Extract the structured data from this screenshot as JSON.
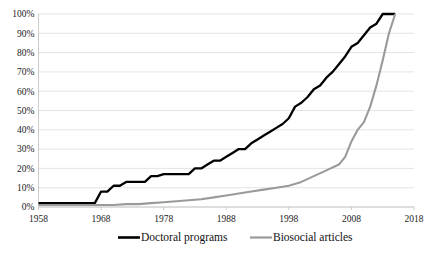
{
  "chart_data": {
    "type": "line",
    "title": "",
    "subtitle": "",
    "xlabel": "",
    "ylabel": "",
    "xlim": [
      1958,
      2018
    ],
    "ylim": [
      0,
      100
    ],
    "grid": true,
    "legend_position": "bottom",
    "y_ticks": [
      "0%",
      "10%",
      "20%",
      "30%",
      "40%",
      "50%",
      "60%",
      "70%",
      "80%",
      "90%",
      "100%"
    ],
    "y_tick_values": [
      0,
      10,
      20,
      30,
      40,
      50,
      60,
      70,
      80,
      90,
      100
    ],
    "x_ticks": [
      "1958",
      "1968",
      "1978",
      "1988",
      "1998",
      "2008",
      "2018"
    ],
    "x_tick_values": [
      1958,
      1968,
      1978,
      1988,
      1998,
      2008,
      2018
    ],
    "series": [
      {
        "name": "Doctoral programs",
        "color": "#000000",
        "width": 2.3,
        "x": [
          1958,
          1959,
          1960,
          1961,
          1962,
          1963,
          1964,
          1965,
          1966,
          1967,
          1968,
          1969,
          1970,
          1971,
          1972,
          1973,
          1974,
          1975,
          1976,
          1977,
          1978,
          1979,
          1980,
          1981,
          1982,
          1983,
          1984,
          1985,
          1986,
          1987,
          1988,
          1989,
          1990,
          1991,
          1992,
          1993,
          1994,
          1995,
          1996,
          1997,
          1998,
          1999,
          2000,
          2001,
          2002,
          2003,
          2004,
          2005,
          2006,
          2007,
          2008,
          2009,
          2010,
          2011,
          2012,
          2013,
          2014,
          2015
        ],
        "values": [
          2,
          2,
          2,
          2,
          2,
          2,
          2,
          2,
          2,
          2,
          8,
          8,
          11,
          11,
          13,
          13,
          13,
          13,
          16,
          16,
          17,
          17,
          17,
          17,
          17,
          20,
          20,
          22,
          24,
          24,
          26,
          28,
          30,
          30,
          33,
          35,
          37,
          39,
          41,
          43,
          46,
          52,
          54,
          57,
          61,
          63,
          67,
          70,
          74,
          78,
          83,
          85,
          89,
          93,
          95,
          100,
          100,
          100
        ]
      },
      {
        "name": "Biosocial articles",
        "color": "#9a9a9a",
        "width": 2.1,
        "x": [
          1958,
          1960,
          1962,
          1964,
          1966,
          1968,
          1970,
          1972,
          1974,
          1976,
          1978,
          1980,
          1982,
          1984,
          1986,
          1988,
          1990,
          1992,
          1994,
          1996,
          1998,
          2000,
          2002,
          2004,
          2006,
          2007,
          2008,
          2009,
          2010,
          2011,
          2012,
          2013,
          2014,
          2015
        ],
        "values": [
          1,
          1,
          1,
          1,
          1,
          1,
          1,
          1.5,
          1.5,
          2,
          2.5,
          3,
          3.5,
          4,
          5,
          6,
          7,
          8,
          9,
          10,
          11,
          13,
          16,
          19,
          22,
          26,
          34,
          40,
          44,
          52,
          63,
          76,
          90,
          100
        ]
      }
    ]
  },
  "legend": {
    "items": [
      {
        "label": "Doctoral programs",
        "color": "#000000",
        "width": 2.6
      },
      {
        "label": "Biosocial articles",
        "color": "#9a9a9a",
        "width": 2.2
      }
    ]
  }
}
